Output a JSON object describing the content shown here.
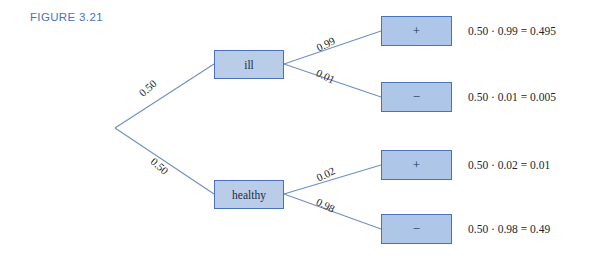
{
  "figure": {
    "label": "FIGURE 3.21",
    "label_color": "#4a72b8"
  },
  "colors": {
    "node_fill": "#b9cde9",
    "leaf_fill": "#aec6e8",
    "border": "#4a72b8",
    "line": "#6f8fc4",
    "text": "#21262c"
  },
  "tree": {
    "root": {
      "branches": [
        {
          "label": "0.50",
          "target": "ill"
        },
        {
          "label": "0.50",
          "target": "healthy"
        }
      ]
    },
    "nodes": [
      {
        "id": "ill",
        "label": "ill",
        "branches": [
          {
            "label": "0.99",
            "outcome": "+"
          },
          {
            "label": "0.01",
            "outcome": "−"
          }
        ]
      },
      {
        "id": "healthy",
        "label": "healthy",
        "branches": [
          {
            "label": "0.02",
            "outcome": "+"
          },
          {
            "label": "0.98",
            "outcome": "−"
          }
        ]
      }
    ],
    "leaves": [
      {
        "symbol": "+",
        "equation": "0.50 · 0.99 = 0.495"
      },
      {
        "symbol": "−",
        "equation": "0.50 · 0.01 = 0.005"
      },
      {
        "symbol": "+",
        "equation": "0.50 · 0.02 = 0.01"
      },
      {
        "symbol": "−",
        "equation": "0.50 · 0.98 = 0.49"
      }
    ]
  }
}
